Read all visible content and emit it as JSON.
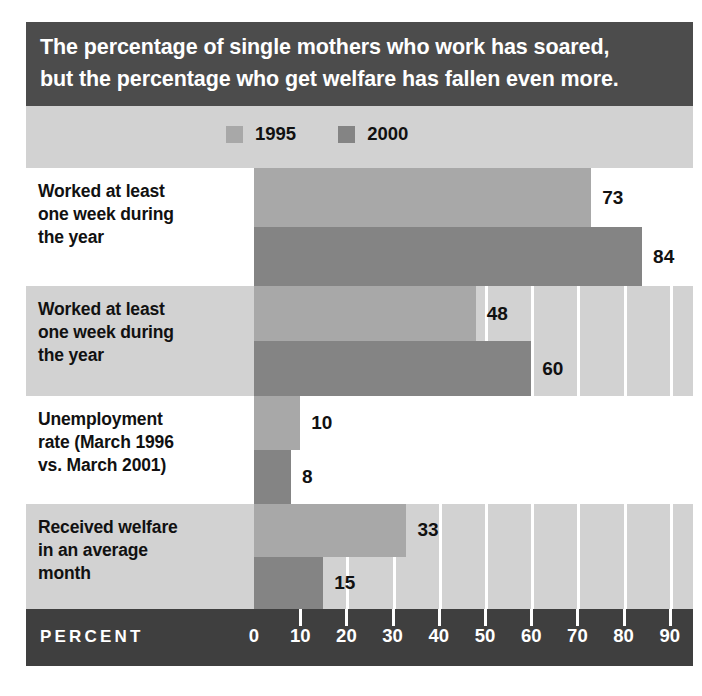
{
  "title": {
    "line1": "The percentage of single mothers who work has soared,",
    "line2": "but the percentage who get welfare has fallen even more."
  },
  "legend": {
    "items": [
      {
        "label": "1995",
        "color": "#a8a8a8"
      },
      {
        "label": "2000",
        "color": "#848484"
      }
    ]
  },
  "axis": {
    "title": "PERCENT",
    "ticks": [
      "0",
      "10",
      "20",
      "30",
      "40",
      "50",
      "60",
      "70",
      "80",
      "90"
    ]
  },
  "colors": {
    "series_1995": "#a8a8a8",
    "series_2000": "#848484",
    "band_light": "#ffffff",
    "band_gray": "#d2d2d2",
    "banner": "#4c4c4c",
    "axis_band": "#3f3f3f",
    "gridline": "#ffffff"
  },
  "chart_data": {
    "type": "bar",
    "orientation": "horizontal",
    "title": "The percentage of single mothers who work has soared, but the percentage who get welfare has fallen even more.",
    "xlabel": "PERCENT",
    "ylabel": "",
    "xlim": [
      0,
      95
    ],
    "xticks": [
      0,
      10,
      20,
      30,
      40,
      50,
      60,
      70,
      80,
      90
    ],
    "grid": true,
    "legend_position": "top",
    "categories": [
      "Worked at least one week during the year",
      "Worked at least one week during the year",
      "Unemployment rate (March 1996 vs. March 2001)",
      "Received welfare in an average month"
    ],
    "series": [
      {
        "name": "1995",
        "values": [
          73,
          48,
          10,
          33
        ]
      },
      {
        "name": "2000",
        "values": [
          84,
          60,
          8,
          15
        ]
      }
    ],
    "rows": [
      {
        "label_lines": [
          "Worked at least",
          "one week during",
          "the year"
        ],
        "band": "light",
        "bars": [
          {
            "series": "1995",
            "value": 73,
            "value_label": "73"
          },
          {
            "series": "2000",
            "value": 84,
            "value_label": "84"
          }
        ]
      },
      {
        "label_lines": [
          "Worked at least",
          "one week during",
          "the year"
        ],
        "band": "gray",
        "bars": [
          {
            "series": "1995",
            "value": 48,
            "value_label": "48"
          },
          {
            "series": "2000",
            "value": 60,
            "value_label": "60"
          }
        ]
      },
      {
        "label_lines": [
          "Unemployment",
          "rate (March 1996",
          "vs. March 2001)"
        ],
        "band": "light",
        "bars": [
          {
            "series": "1995",
            "value": 10,
            "value_label": "10"
          },
          {
            "series": "2000",
            "value": 8,
            "value_label": "8"
          }
        ]
      },
      {
        "label_lines": [
          "Received welfare",
          "in an average",
          "month"
        ],
        "band": "gray",
        "bars": [
          {
            "series": "1995",
            "value": 33,
            "value_label": "33"
          },
          {
            "series": "2000",
            "value": 15,
            "value_label": "15"
          }
        ]
      }
    ]
  }
}
